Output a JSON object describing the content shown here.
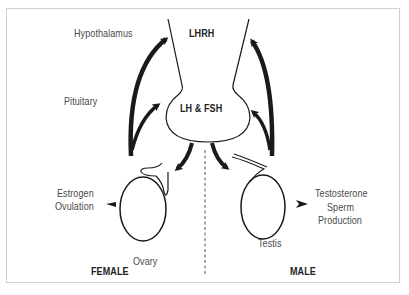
{
  "diagram": {
    "title": "",
    "labels": {
      "hypothalamus": "Hypothalamus",
      "pituitary": "Pituitary",
      "lhrh": "LHRH",
      "lh_fsh": "LH & FSH",
      "estrogen": "Estrogen",
      "ovulation": "Ovulation",
      "ovary": "Ovary",
      "testosterone": "Testosterone",
      "sperm": "Sperm",
      "production": "Production",
      "testis": "Testis",
      "female": "FEMALE",
      "male": "MALE"
    },
    "colors": {
      "stroke": "#1a1a1a",
      "text": "#4a4a4a",
      "frame": "#cfcfcf"
    }
  }
}
